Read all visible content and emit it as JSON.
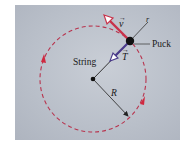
{
  "diagram": {
    "labels": {
      "velocity": "v",
      "tension": "T",
      "string": "String",
      "puck": "Puck",
      "radius": "R",
      "radial_axis": "r"
    },
    "colors": {
      "panel_bg": "#bcc2cc",
      "velocity_arrow": "#c8324a",
      "tension_arrow": "#4a3a8a",
      "circle_path": "#b8344e",
      "string_line": "#333333"
    },
    "geometry": {
      "center": [
        93,
        79
      ],
      "radius": 53,
      "puck": [
        130,
        41
      ]
    }
  }
}
